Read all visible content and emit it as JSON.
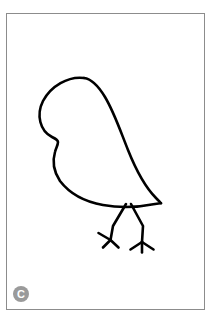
{
  "page": {
    "background_color": "#ffffff",
    "width": 219,
    "height": 332
  },
  "frame": {
    "border_color": "#8c8c8c",
    "fill_color": "#ffffff",
    "x": 6,
    "y": 13,
    "width": 199,
    "height": 297
  },
  "badge": {
    "label": "C",
    "background_color": "#9a9a9a",
    "text_color": "#ffffff"
  },
  "artwork": {
    "title": "bird-line-drawing",
    "stroke_color": "#000000",
    "fill_color": "none",
    "description": "Simple black outline drawing of a perched bird with a rounded head and body, a pointed tail, and two thin legs with three-toed feet.",
    "paths": {
      "body": "M 84 78 C 66 76 48 88 41 104 C 35 118 40 132 52 138 C 55 139 57 140 58 141 C 59 142 59 145 58 147 C 55 152 54 160 56 168 C 60 183 74 195 92 201 C 108 207 130 208 148 205 C 154 204 158 203 160 203 C 156 200 150 196 144 190 C 132 178 123 162 116 144 C 110 128 104 112 97 98 C 93 89 89 81 84 78 Z",
      "neck_notch": "M 52 138 C 55 139 57 140 58 141 C 59 142 59 145 58 147",
      "leg_left_upper": "M 126 204 L 113 226",
      "leg_left_lower": "M 113 226 L 111 240",
      "foot_left_toe_outer": "M 111 240 L 99 233",
      "foot_left_toe_mid": "M 111 240 L 103 247",
      "foot_left_toe_inner": "M 111 240 L 118 247",
      "leg_right_upper": "M 131 204 L 143 226",
      "leg_right_lower": "M 143 226 L 142 242",
      "foot_right_toe_outer": "M 142 242 L 131 249",
      "foot_right_toe_mid": "M 142 242 L 142 252",
      "foot_right_toe_inner": "M 142 242 L 153 249"
    }
  }
}
